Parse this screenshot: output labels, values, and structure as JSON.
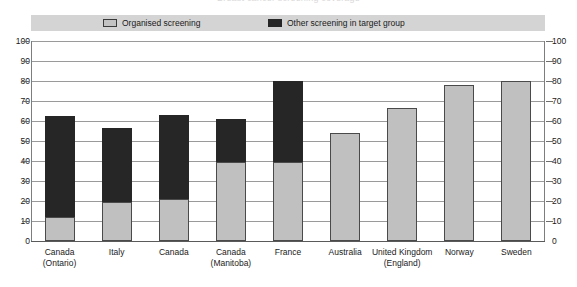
{
  "chart_data": {
    "type": "bar",
    "subtype": "stacked",
    "title": "Breast cancer screening coverage",
    "categories": [
      "Canada\n(Ontario)",
      "Italy",
      "Canada",
      "Canada\n(Manitoba)",
      "France",
      "Australia",
      "United Kingdom\n(England)",
      "Norway",
      "Sweden"
    ],
    "series": [
      {
        "name": "Organised screening",
        "color": "#c0c0c0",
        "values": [
          12,
          19.5,
          21,
          39.5,
          39.5,
          54,
          66.5,
          78,
          80
        ]
      },
      {
        "name": "Other screening in target group",
        "color": "#262626",
        "values": [
          50.5,
          37,
          42,
          21.5,
          40.5,
          0,
          0,
          0,
          0
        ]
      }
    ],
    "totals": [
      62.5,
      56.5,
      63,
      61,
      80,
      54,
      66.5,
      78,
      80
    ],
    "xlabel": "",
    "ylabel": "",
    "ylim": [
      0,
      100
    ],
    "yticks": [
      0,
      10,
      20,
      30,
      40,
      50,
      60,
      70,
      80,
      90,
      100
    ],
    "ytick_labels_left": [
      "100",
      "90",
      "80",
      "70",
      "60",
      "50",
      "40",
      "30",
      "20",
      "10",
      "0"
    ],
    "ytick_labels_right": [
      "100",
      "90",
      "80",
      "70",
      "60",
      "50",
      "40",
      "30",
      "20",
      "10",
      "0"
    ],
    "grid": true,
    "legend_position": "top"
  },
  "legend": {
    "organised_label": "Organised screening",
    "other_label": "Other screening in target group"
  }
}
